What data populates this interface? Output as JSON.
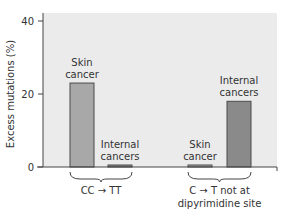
{
  "chart_data": {
    "type": "bar",
    "title": "",
    "xlabel": "",
    "ylabel": "Excess mutations (%)",
    "ylim": [
      0,
      40
    ],
    "yticks": [
      0,
      20,
      40
    ],
    "grid": false,
    "legend": null,
    "groups": [
      {
        "label_line1": "CC → TT",
        "label_line2": ""
      },
      {
        "label_line1": "C → T not at",
        "label_line2": "dipyrimidine site"
      }
    ],
    "bars": [
      {
        "group": 0,
        "label_line1": "Skin",
        "label_line2": "cancer",
        "value": 23,
        "color": "#a8a8a8"
      },
      {
        "group": 0,
        "label_line1": "Internal",
        "label_line2": "cancers",
        "value": 0.3,
        "color": "#8a8a8a"
      },
      {
        "group": 1,
        "label_line1": "Skin",
        "label_line2": "cancer",
        "value": 0.3,
        "color": "#a8a8a8"
      },
      {
        "group": 1,
        "label_line1": "Internal",
        "label_line2": "cancers",
        "value": 18,
        "color": "#8a8a8a"
      }
    ],
    "categories": [
      "CC→TT: Skin cancer",
      "CC→TT: Internal cancers",
      "C→T not at dipyrimidine site: Skin cancer",
      "C→T not at dipyrimidine site: Internal cancers"
    ],
    "values": [
      23,
      0.3,
      0.3,
      18
    ]
  },
  "colors": {
    "plot_background": "#ebebeb",
    "axis": "#444444",
    "bar_outline": "#4a4a4a"
  },
  "layout": {
    "plot_left": 43,
    "plot_right": 277,
    "plot_top": 13,
    "plot_bottom": 167,
    "y_px_per_unit": 3.65,
    "bar_x": [
      70,
      108,
      188,
      227
    ],
    "bar_width": 24
  }
}
